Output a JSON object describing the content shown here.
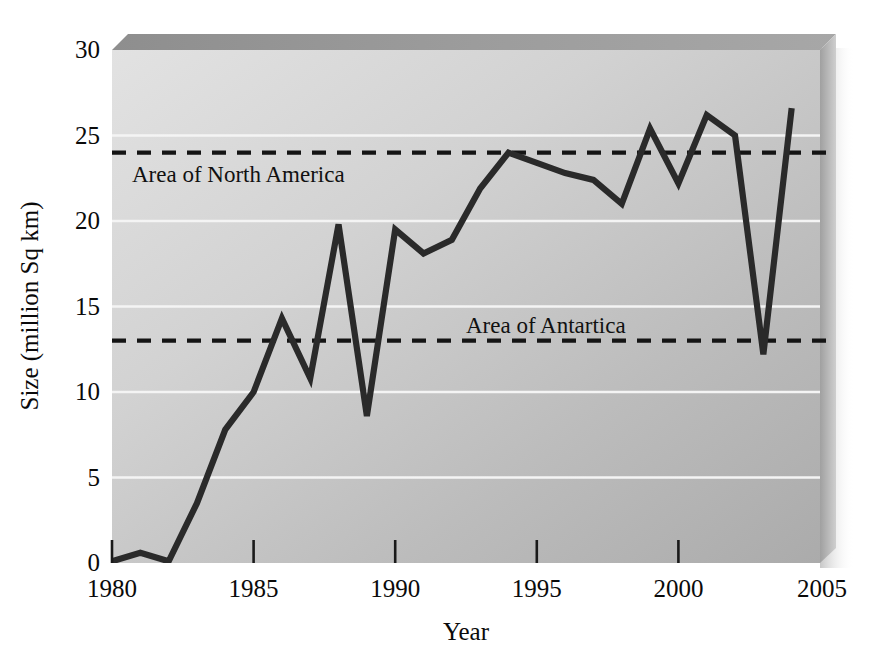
{
  "chart_data": {
    "type": "line",
    "title": "",
    "subtitle": "",
    "xlabel": "Year",
    "ylabel": "Size (million Sq km)",
    "xlim": [
      1980,
      2005
    ],
    "ylim": [
      0,
      30
    ],
    "xticks": [
      1980,
      1985,
      1990,
      1995,
      2000,
      2005
    ],
    "xtick_labels": [
      "1980",
      "1985",
      "1990",
      "1995",
      "2000",
      "2005"
    ],
    "yticks": [
      0,
      5,
      10,
      15,
      20,
      25,
      30
    ],
    "ytick_labels": [
      "0",
      "5",
      "10",
      "15",
      "20",
      "25",
      "30"
    ],
    "grid": "horizontal-white-gridlines",
    "legend": "none",
    "plot_background": "gray-gradient-3d-panel",
    "x": [
      1980,
      1981,
      1982,
      1983,
      1984,
      1985,
      1986,
      1987,
      1988,
      1989,
      1990,
      1991,
      1992,
      1993,
      1994,
      1995,
      1996,
      1997,
      1998,
      1999,
      2000,
      2001,
      2002,
      2003,
      2004
    ],
    "series": [
      {
        "name": "Ozone hole size",
        "color": "#2a2a2a",
        "values": [
          0.1,
          0.6,
          0.1,
          3.5,
          7.8,
          10.0,
          14.3,
          10.8,
          19.8,
          8.6,
          19.5,
          18.1,
          18.9,
          21.9,
          24.0,
          23.4,
          22.8,
          22.4,
          21.0,
          25.4,
          22.2,
          26.2,
          25.0,
          12.2,
          26.6
        ]
      }
    ],
    "reference_lines": [
      {
        "label": "Area of North America",
        "value": 24.0,
        "style": "dashed",
        "color": "#111111",
        "label_x": 1981.1,
        "label_y": 22.3
      },
      {
        "label": "Area of Antartica",
        "value": 13.0,
        "style": "dashed",
        "color": "#111111",
        "label_x": 1992.4,
        "label_y": 14.3
      }
    ],
    "annotations": []
  }
}
